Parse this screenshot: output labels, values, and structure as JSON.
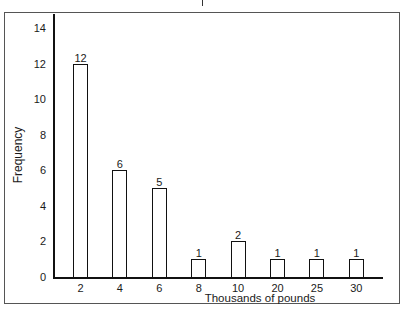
{
  "chart_data": {
    "type": "bar",
    "title": "",
    "xlabel": "Thousands of pounds",
    "ylabel": "Frequency",
    "categories": [
      "2",
      "4",
      "6",
      "8",
      "10",
      "20",
      "25",
      "30"
    ],
    "values": [
      12,
      6,
      5,
      1,
      2,
      1,
      1,
      1
    ],
    "data_labels": [
      "12",
      "6",
      "5",
      "1",
      "2",
      "1",
      "1",
      "1"
    ],
    "yticks": [
      "0",
      "2",
      "4",
      "6",
      "8",
      "10",
      "12",
      "14"
    ],
    "ylim": [
      0,
      14
    ],
    "grid": false,
    "legend": null
  }
}
